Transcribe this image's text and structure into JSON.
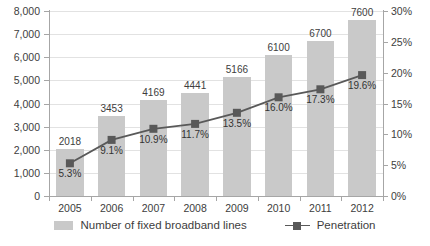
{
  "chart_data": {
    "type": "bar",
    "title": "",
    "subtitle": "",
    "xlabel": "",
    "ylabel": "",
    "categories": [
      "2005",
      "2006",
      "2007",
      "2008",
      "2009",
      "2010",
      "2011",
      "2012"
    ],
    "series": [
      {
        "name": "Number of fixed broadband lines",
        "type": "bar",
        "axis": "left",
        "color": "#c9c9c9",
        "values": [
          2018,
          3453,
          4169,
          4441,
          5166,
          6100,
          6700,
          7600
        ],
        "value_labels": [
          "2018",
          "3453",
          "4169",
          "4441",
          "5166",
          "6100",
          "6700",
          "7600"
        ]
      },
      {
        "name": "Penetration",
        "type": "line",
        "axis": "right",
        "color": "#595959",
        "values": [
          5.3,
          9.1,
          10.9,
          11.7,
          13.5,
          16.0,
          17.3,
          19.6
        ],
        "value_labels": [
          "5.3%",
          "9.1%",
          "10.9%",
          "11.7%",
          "13.5%",
          "16.0%",
          "17.3%",
          "19.6%"
        ]
      }
    ],
    "left_axis": {
      "min": 0,
      "max": 8000,
      "step": 1000,
      "ticks": [
        "0",
        "1,000",
        "2,000",
        "3,000",
        "4,000",
        "5,000",
        "6,000",
        "7,000",
        "8,000"
      ]
    },
    "right_axis": {
      "min": 0,
      "max": 30,
      "step": 5,
      "ticks": [
        "0%",
        "5%",
        "10%",
        "15%",
        "20%",
        "25%",
        "30%"
      ]
    },
    "grid": true,
    "legend_position": "bottom",
    "legend": [
      {
        "label": "Number of fixed broadband lines",
        "marker": "bar-swatch",
        "color": "#c9c9c9"
      },
      {
        "label": "Penetration",
        "marker": "line-square-swatch",
        "color": "#595959"
      }
    ]
  }
}
